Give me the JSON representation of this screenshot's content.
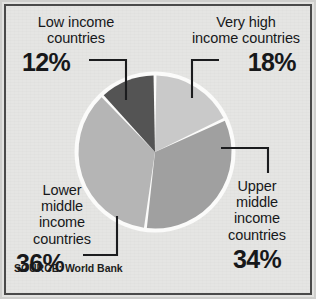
{
  "chart_data": {
    "type": "pie",
    "title": "",
    "categories": [
      "Very high income countries",
      "Upper middle income countries",
      "Lower middle income countries",
      "Low income countries"
    ],
    "values": [
      18,
      34,
      36,
      12
    ],
    "value_labels": [
      "18%",
      "34%",
      "36%",
      "12%"
    ],
    "unit": "%",
    "colors": [
      "#c9c9c9",
      "#a0a0a0",
      "#b5b5b5",
      "#545454"
    ],
    "start_angle_deg": 0,
    "direction": "clockwise",
    "slice_gap": true,
    "slice_gap_color": "#ffffff",
    "legend": "inline-labels-with-leader-lines",
    "grid": false,
    "source": "SOURCE: World Bank"
  },
  "labels": {
    "low": {
      "line1": "Low income",
      "line2": "countries",
      "percent": "12%"
    },
    "very_high": {
      "line1": "Very high",
      "line2": "income countries",
      "percent": "18%"
    },
    "lower_middle": {
      "line1": "Lower",
      "line2": "middle",
      "line3": "income",
      "line4": "countries",
      "percent": "36%"
    },
    "upper_middle": {
      "line1": "Upper",
      "line2": "middle",
      "line3": "income",
      "line4": "countries",
      "percent": "34%"
    }
  },
  "footer": {
    "source": "SOURCE: World Bank"
  },
  "style": {
    "background": "#e5e5e3",
    "frame_color": "#4a4a4a",
    "text_color": "#17181a",
    "leader_color": "#1b1c1e"
  }
}
